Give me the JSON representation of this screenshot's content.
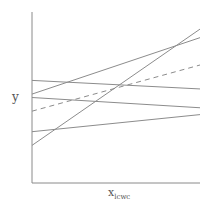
{
  "chart_data": {
    "type": "line",
    "title": "",
    "xlabel": "x",
    "xlabel_subscript": "lcwc",
    "ylabel": "y",
    "grid": false,
    "legend": null,
    "x": [
      0,
      1
    ],
    "xlim": [
      0,
      1
    ],
    "ylim": [
      0,
      1
    ],
    "series": [
      {
        "name": "line-1",
        "style": "solid",
        "values": [
          0.6,
          0.55
        ]
      },
      {
        "name": "line-2",
        "style": "solid",
        "values": [
          0.52,
          0.85
        ]
      },
      {
        "name": "line-3",
        "style": "solid",
        "values": [
          0.5,
          0.44
        ]
      },
      {
        "name": "line-4-dashed",
        "style": "dashed",
        "values": [
          0.42,
          0.69
        ]
      },
      {
        "name": "line-5",
        "style": "solid",
        "values": [
          0.3,
          0.4
        ]
      },
      {
        "name": "line-6",
        "style": "solid",
        "values": [
          0.22,
          0.9
        ]
      }
    ]
  },
  "plot": {
    "left": 32,
    "right": 200,
    "top": 12,
    "bottom": 183,
    "line_color": "#8c8c8c",
    "axis_color": "#8a8a8a"
  }
}
